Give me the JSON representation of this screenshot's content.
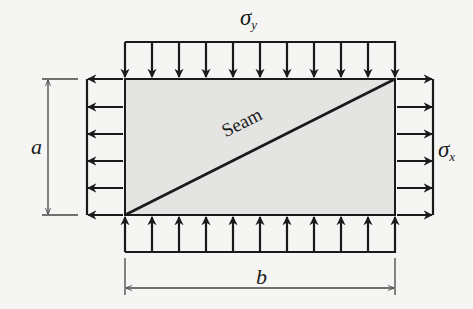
{
  "diagram": {
    "type": "biaxially-loaded-plate-with-seam",
    "labels": {
      "sigma_y": {
        "base": "σ",
        "sub": "y"
      },
      "sigma_x": {
        "base": "σ",
        "sub": "x"
      },
      "dim_a": "a",
      "dim_b": "b",
      "seam": "Seam"
    },
    "plate": {
      "x": 125,
      "y": 79,
      "width": 270,
      "height": 136,
      "fill": "#e4e4e2",
      "stroke": "#1a1a1a"
    },
    "loads": {
      "top_arrow_count": 11,
      "bottom_arrow_count": 11,
      "left_arrow_count": 6,
      "right_arrow_count": 6,
      "top_direction": "down (compressive)",
      "bottom_direction": "up (compressive)",
      "left_direction": "left (tensile)",
      "right_direction": "right (tensile)"
    },
    "colors": {
      "line": "#1a1a1a",
      "plate_fill": "#e4e4e2",
      "background": "#f5f5f3",
      "dimension": "#444444"
    }
  }
}
